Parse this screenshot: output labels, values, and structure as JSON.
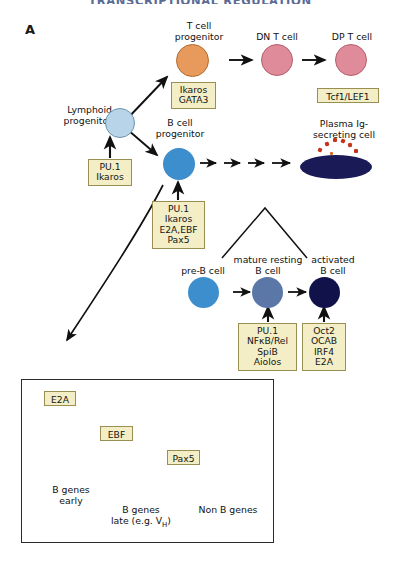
{
  "header": {
    "title": "TRANSCRIPTIONAL REGULATION",
    "title_color": "#5a6b96"
  },
  "panels": {
    "a": {
      "letter": "A"
    },
    "b": {
      "letter": "B"
    }
  },
  "palette": {
    "t_progenitor": "#e89a5c",
    "t_progenitor_border": "#b06a2e",
    "t_cell_pink": "#e08b9a",
    "t_cell_pink_border": "#b4606f",
    "lymphoid_blue": "#b8d4e8",
    "lymphoid_blue_border": "#6d93ae",
    "b_progenitor_blue": "#3d8ecc",
    "preb_blue": "#3d8ecc",
    "mature_blue": "#5a77a8",
    "activated_navy": "#12124a",
    "plasma_navy": "#191a56",
    "ig_dot": "#c4341d",
    "box_fill": "#f3eec5",
    "box_border": "#9a8f52",
    "arrow_black": "#111111",
    "arrow_green": "#4a9040",
    "arrow_red": "#a84020"
  },
  "panel_a": {
    "cells": [
      {
        "name": "lymphoid-progenitor",
        "label": "Lymphoid\nprogenitor",
        "label_line1": "Lymphoid",
        "label_line2": "progenitor",
        "color": "#b8d4e8"
      },
      {
        "name": "t-cell-progenitor",
        "label_line1": "T cell",
        "label_line2": "progenitor",
        "color": "#e89a5c"
      },
      {
        "name": "dn-t-cell",
        "label_line1": "DN T cell",
        "label_line2": "",
        "color": "#e08b9a"
      },
      {
        "name": "dp-t-cell",
        "label_line1": "DP T cell",
        "label_line2": "",
        "color": "#e08b9a"
      },
      {
        "name": "b-cell-progenitor",
        "label_line1": "B cell",
        "label_line2": "progenitor",
        "color": "#3d8ecc"
      },
      {
        "name": "plasma-ig-secreting-cell",
        "label_line1": "Plasma Ig-",
        "label_line2": "secreting cell",
        "color": "#191a56"
      },
      {
        "name": "pre-b-cell",
        "label_line1": "pre-B cell",
        "label_line2": "",
        "color": "#3d8ecc"
      },
      {
        "name": "mature-resting-b-cell",
        "label_line1": "mature resting",
        "label_line2": "B cell",
        "color": "#5a77a8"
      },
      {
        "name": "activated-b-cell",
        "label_line1": "activated",
        "label_line2": "B cell",
        "color": "#12124a"
      }
    ],
    "factor_boxes": [
      {
        "name": "factors-t-progenitor",
        "lines": [
          "Ikaros",
          "GATA3"
        ]
      },
      {
        "name": "factors-dp-t-cell",
        "lines": [
          "Tcf1/LEF1"
        ]
      },
      {
        "name": "factors-lymphoid-progenitor",
        "lines": [
          "PU.1",
          "Ikaros"
        ]
      },
      {
        "name": "factors-b-cell-progenitor",
        "lines": [
          "PU.1",
          "Ikaros",
          "E2A,EBF",
          "Pax5"
        ]
      },
      {
        "name": "factors-mature-resting-b-cell",
        "lines": [
          "PU.1",
          "NFκB/Rel",
          "SpiB",
          "Aiolos"
        ]
      },
      {
        "name": "factors-activated-b-cell",
        "lines": [
          "Oct2",
          "OCAB",
          "IRF4",
          "E2A"
        ]
      }
    ]
  },
  "panel_b": {
    "factor_boxes": [
      {
        "name": "factor-e2a",
        "label": "E2A"
      },
      {
        "name": "factor-ebf",
        "label": "EBF"
      },
      {
        "name": "factor-pax5",
        "label": "Pax5"
      }
    ],
    "targets": [
      {
        "name": "target-b-genes-early",
        "line1": "B genes",
        "line2": "early"
      },
      {
        "name": "target-b-genes-late",
        "line1": "B genes",
        "line2_pre": "late (e.g. V",
        "line2_sub": "H",
        "line2_post": ")"
      },
      {
        "name": "target-non-b-genes",
        "line1": "Non B genes",
        "line2": ""
      }
    ]
  }
}
